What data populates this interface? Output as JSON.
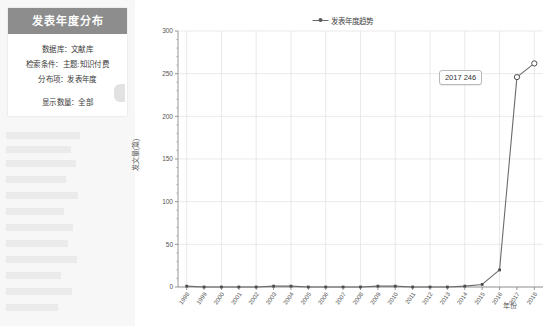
{
  "panel": {
    "title": "发表年度分布",
    "rows": [
      {
        "name": "database",
        "text": "数据库：文献库"
      },
      {
        "name": "condition",
        "text": "检索条件：主题:知识付费"
      },
      {
        "name": "dimension",
        "text": "分布项：发表年度"
      },
      {
        "name": "count",
        "text": "显示数量：全部"
      }
    ]
  },
  "legend": {
    "label": "发表年度趋势"
  },
  "tooltip": {
    "text": "2017  246"
  },
  "colors": {
    "line": "#6b6b6b",
    "marker": "#4d4d4d",
    "grid": "#dcdcdc",
    "axis": "#8c8c8c",
    "panel_header": "#8d8d8d",
    "text": "#3a3a3a"
  },
  "chart_data": {
    "type": "line",
    "title": "",
    "xlabel": "年份",
    "ylabel": "发文量(篇)",
    "legend_position": "top-center",
    "grid": true,
    "ylim": [
      0,
      300
    ],
    "yticks": [
      0,
      50,
      100,
      150,
      200,
      250,
      300
    ],
    "categories": [
      "1998",
      "1999",
      "2000",
      "2001",
      "2002",
      "2003",
      "2004",
      "2005",
      "2006",
      "2007",
      "2008",
      "2009",
      "2010",
      "2011",
      "2012",
      "2013",
      "2014",
      "2015",
      "2016",
      "2017",
      "2018"
    ],
    "series": [
      {
        "name": "发表年度趋势",
        "values": [
          1,
          0,
          0,
          0,
          0,
          1,
          1,
          0,
          0,
          0,
          0,
          1,
          1,
          0,
          0,
          0,
          1,
          3,
          20,
          246,
          262
        ]
      }
    ],
    "annotations": [
      {
        "x": "2017",
        "y": 246,
        "text": "2017  246"
      }
    ]
  }
}
